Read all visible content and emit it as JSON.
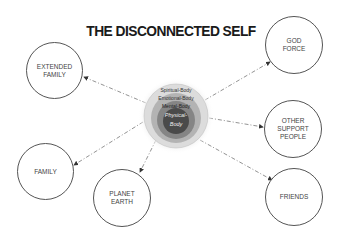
{
  "title": "THE DISCONNECTED SELF",
  "center": {
    "layers": [
      {
        "label": "Spiritual-Body",
        "color": "#d8d8d8"
      },
      {
        "label": "Emotional-Body",
        "color": "#b5b5b5"
      },
      {
        "label": "Mental-Body",
        "color": "#8a8a8a"
      },
      {
        "label": "Physical-Body",
        "color": "#4a4a4a"
      }
    ],
    "physical_line1": "Physical-",
    "physical_line2": "Body"
  },
  "nodes": [
    {
      "id": "extended-family",
      "label": "EXTENDED\nFAMILY"
    },
    {
      "id": "family",
      "label": "FAMILY"
    },
    {
      "id": "planet-earth",
      "label": "PLANET\nEARTH"
    },
    {
      "id": "god-force",
      "label": "GOD\nFORCE"
    },
    {
      "id": "other-support-people",
      "label": "OTHER\nSUPPORT\nPEOPLE"
    },
    {
      "id": "friends",
      "label": "FRIENDS"
    }
  ],
  "edges": [
    {
      "from": "self",
      "to": "extended-family",
      "style": "dashed-arrow"
    },
    {
      "from": "self",
      "to": "family",
      "style": "dashed-arrow"
    },
    {
      "from": "self",
      "to": "planet-earth",
      "style": "dashed-arrow"
    },
    {
      "from": "self",
      "to": "god-force",
      "style": "dashed-arrow"
    },
    {
      "from": "self",
      "to": "other-support-people",
      "style": "dashed-arrow"
    },
    {
      "from": "self",
      "to": "friends",
      "style": "dashed-arrow"
    }
  ]
}
